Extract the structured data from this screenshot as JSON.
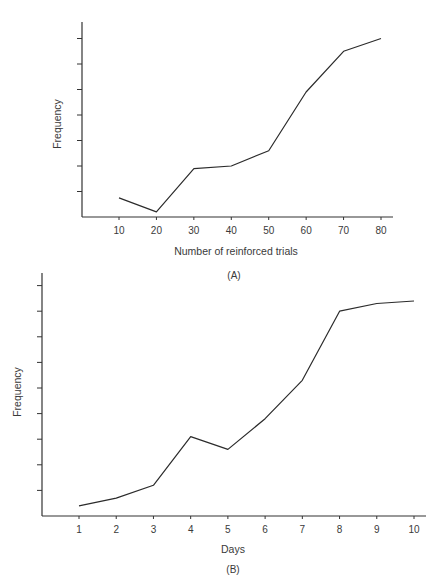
{
  "chart_data": [
    {
      "type": "line",
      "panel": "(A)",
      "title": "",
      "xlabel": "Number of reinforced trials",
      "ylabel": "Frequency",
      "categories": [
        "10",
        "20",
        "30",
        "40",
        "50",
        "60",
        "70",
        "80"
      ],
      "x": [
        10,
        20,
        30,
        40,
        50,
        60,
        70,
        80
      ],
      "values": [
        0.75,
        0.2,
        1.9,
        2.0,
        2.6,
        4.9,
        6.5,
        7.0
      ],
      "y_ticks": 7,
      "ylim": [
        0,
        7.5
      ],
      "y_tick_labels": "none",
      "grid": false,
      "legend": null
    },
    {
      "type": "line",
      "panel": "(B)",
      "title": "",
      "xlabel": "Days",
      "ylabel": "Frequency",
      "categories": [
        "1",
        "2",
        "3",
        "4",
        "5",
        "6",
        "7",
        "8",
        "9",
        "10"
      ],
      "x": [
        1,
        2,
        3,
        4,
        5,
        6,
        7,
        8,
        9,
        10
      ],
      "values": [
        0.4,
        0.7,
        1.2,
        3.1,
        2.6,
        3.8,
        5.3,
        8.0,
        8.3,
        8.4
      ],
      "y_ticks": 9,
      "ylim": [
        0,
        9.5
      ],
      "y_tick_labels": "none",
      "grid": false,
      "legend": null
    }
  ],
  "panels": {
    "a": {
      "caption": "(A)",
      "xlabel": "Number of reinforced trials",
      "ylabel": "Frequency"
    },
    "b": {
      "caption": "(B)",
      "xlabel": "Days",
      "ylabel": "Frequency"
    }
  },
  "colors": {
    "line": "#2b2b2b",
    "axis": "#333333",
    "text": "#3a3a3a"
  }
}
